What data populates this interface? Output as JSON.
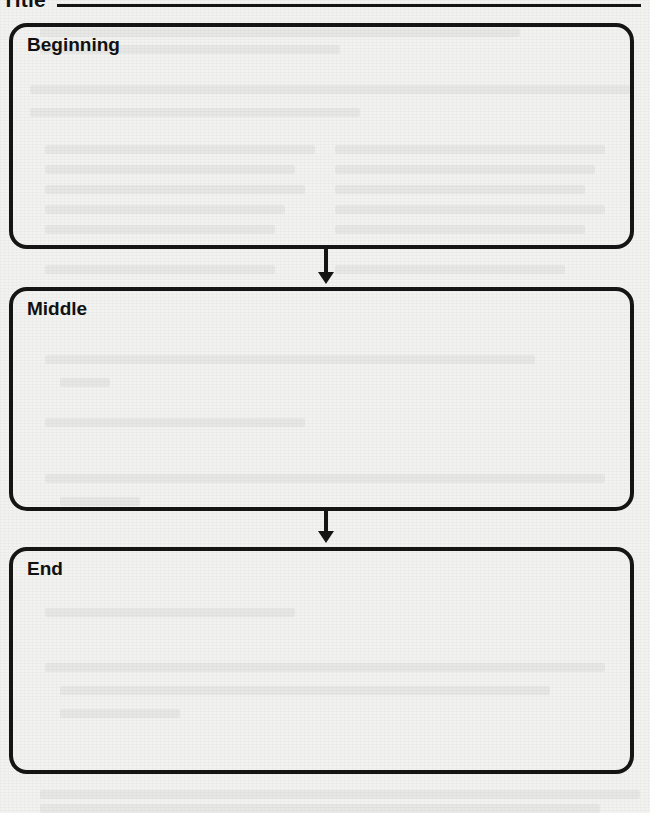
{
  "page": {
    "title_label": "Title",
    "title_value": ""
  },
  "organizer": {
    "type": "sequence-chart",
    "sections": [
      {
        "id": "beginning",
        "heading": "Beginning",
        "content": ""
      },
      {
        "id": "middle",
        "heading": "Middle",
        "content": ""
      },
      {
        "id": "end",
        "heading": "End",
        "content": ""
      }
    ],
    "connectors": [
      {
        "from": "beginning",
        "to": "middle",
        "icon": "arrow-down-icon"
      },
      {
        "from": "middle",
        "to": "end",
        "icon": "arrow-down-icon"
      }
    ]
  },
  "colors": {
    "ink": "#151515",
    "paper": "#f2f2f0"
  }
}
